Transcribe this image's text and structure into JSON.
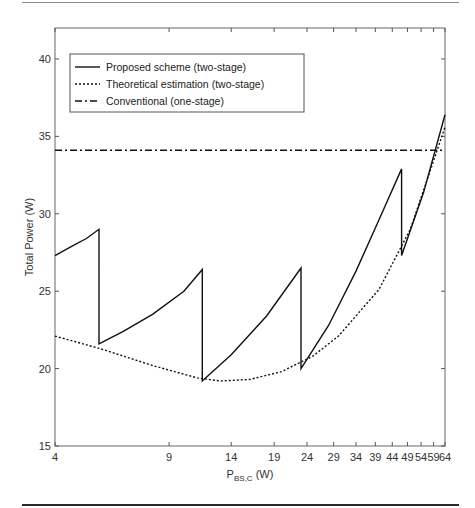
{
  "chart_data": {
    "type": "line",
    "title": "",
    "xlabel": "P_BS,C (W)",
    "xlabel_main": "P",
    "xlabel_sub": "BS,C",
    "xlabel_unit": " (W)",
    "ylabel": "Total Power (W)",
    "xscale": "log",
    "xlim": [
      4,
      64
    ],
    "ylim": [
      15,
      42
    ],
    "grid": false,
    "legend_position": "upper left",
    "x_ticks": [
      4,
      9,
      14,
      19,
      24,
      29,
      34,
      39,
      44,
      49,
      54,
      59,
      64
    ],
    "x_tick_labels": [
      "4",
      "9",
      "14",
      "19",
      "24",
      "29",
      "34",
      "39",
      "44",
      "49",
      "54",
      "59",
      "64"
    ],
    "y_ticks": [
      15,
      20,
      25,
      30,
      35,
      40
    ],
    "y_tick_labels": [
      "15",
      "20",
      "25",
      "30",
      "35",
      "40"
    ],
    "series": [
      {
        "name": "Proposed scheme (two-stage)",
        "style": "solid",
        "color": "#111111",
        "x": [
          4,
          4.5,
          5,
          5.47,
          5.47,
          6.5,
          8,
          10,
          11.4,
          11.4,
          14,
          18,
          23,
          23,
          28,
          34,
          40,
          47,
          47,
          55,
          64
        ],
        "y": [
          27.3,
          27.9,
          28.4,
          29.0,
          21.6,
          22.4,
          23.5,
          25.0,
          26.4,
          19.2,
          20.9,
          23.4,
          26.5,
          20.0,
          22.8,
          26.3,
          29.6,
          32.9,
          27.3,
          31.4,
          36.4
        ]
      },
      {
        "name": "Theoretical estimation (two-stage)",
        "style": "dotted",
        "color": "#111111",
        "x": [
          4,
          5.5,
          8,
          11,
          13,
          16,
          20,
          25,
          30,
          40,
          50,
          64
        ],
        "y": [
          22.1,
          21.3,
          20.2,
          19.4,
          19.2,
          19.3,
          19.8,
          20.8,
          22.1,
          25.1,
          29.0,
          35.6
        ]
      },
      {
        "name": "Conventional (one-stage)",
        "style": "dashdot",
        "color": "#111111",
        "x": [
          4,
          64
        ],
        "y": [
          34.1,
          34.1
        ]
      }
    ]
  }
}
